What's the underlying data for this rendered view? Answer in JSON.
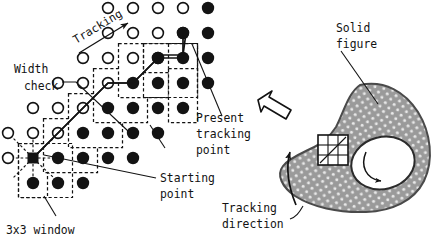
{
  "figure": {
    "background": "#ffffff",
    "ink": "#131313",
    "fill_gray": "#9a9a9a"
  },
  "labels": {
    "tracking": "Tracking",
    "width_check_line1": "Width",
    "width_check_line2": "check",
    "present_line1": "Present",
    "present_line2": "tracking",
    "present_line3": "point",
    "starting_line1": "Starting",
    "starting_line2": "point",
    "window_label": "3x3 window",
    "solid_line1": "Solid",
    "solid_line2": "figure",
    "direction_line1": "Tracking",
    "direction_line2": "direction"
  },
  "grid": {
    "origin_x": 33,
    "origin_y": 183,
    "step": 25,
    "open_radius": 5.4,
    "filled_radius": 6.2,
    "note": "dot lattice; row 0 is bottom. open = background pixel, filled = figure pixel",
    "open_dots": [
      [
        -1,
        1
      ],
      [
        -1,
        2
      ],
      [
        0,
        2
      ],
      [
        0,
        3
      ],
      [
        1,
        2
      ],
      [
        1,
        3
      ],
      [
        1,
        4
      ],
      [
        2,
        4
      ],
      [
        2,
        3
      ],
      [
        2,
        5
      ],
      [
        3,
        5
      ],
      [
        3,
        4
      ],
      [
        3,
        6
      ],
      [
        4,
        6
      ],
      [
        4,
        5
      ],
      [
        4,
        7
      ],
      [
        5,
        7
      ],
      [
        5,
        6
      ],
      [
        5,
        8
      ],
      [
        6,
        8
      ],
      [
        6,
        7
      ],
      [
        6,
        9
      ],
      [
        7,
        9
      ],
      [
        7,
        8
      ],
      [
        8,
        9
      ],
      [
        7,
        10
      ],
      [
        8,
        10
      ]
    ],
    "filled_dots": [
      [
        0,
        0
      ],
      [
        1,
        0
      ],
      [
        2,
        0
      ],
      [
        3,
        0
      ],
      [
        0,
        1
      ],
      [
        1,
        1
      ],
      [
        2,
        1
      ],
      [
        3,
        1
      ],
      [
        4,
        1
      ],
      [
        2,
        2
      ],
      [
        3,
        2
      ],
      [
        4,
        2
      ],
      [
        5,
        2
      ],
      [
        3,
        3
      ],
      [
        4,
        3
      ],
      [
        5,
        3
      ],
      [
        6,
        3
      ],
      [
        4,
        4
      ],
      [
        5,
        4
      ],
      [
        6,
        4
      ],
      [
        7,
        4
      ],
      [
        5,
        5
      ],
      [
        6,
        5
      ],
      [
        7,
        5
      ],
      [
        6,
        6
      ],
      [
        7,
        6
      ],
      [
        8,
        6
      ],
      [
        7,
        7
      ],
      [
        8,
        7
      ],
      [
        8,
        8
      ],
      [
        8,
        9
      ]
    ],
    "starting_point": [
      0,
      1
    ],
    "present_tracking_point": [
      7,
      7
    ]
  },
  "windows": {
    "label": "3x3 sliding windows along the contour",
    "boxes": [
      {
        "cx": 0,
        "cy": 1
      },
      {
        "cx": 1,
        "cy": 2
      },
      {
        "cx": 2,
        "cy": 3
      },
      {
        "cx": 3,
        "cy": 4
      },
      {
        "cx": 4,
        "cy": 5
      },
      {
        "cx": 5,
        "cy": 6
      },
      {
        "cx": 6,
        "cy": 7
      },
      {
        "cx": 7,
        "cy": 8
      }
    ]
  },
  "track_path": {
    "label": "tracking polyline from starting point to present tracking point",
    "points": [
      [
        0,
        1
      ],
      [
        1,
        2
      ],
      [
        2,
        3
      ],
      [
        3,
        4
      ],
      [
        4,
        5
      ],
      [
        5,
        6
      ],
      [
        6,
        7
      ],
      [
        7,
        7
      ]
    ]
  },
  "radial_probe": {
    "label": "8-neighbour dashed probe rays at starting point",
    "directions": 8
  },
  "solid_figure": {
    "label": "speckled closed region with interior hole",
    "hole_label": "interior hole with curved arrow",
    "window_cells": 3
  },
  "arrows": {
    "tracking_arrow": "diagonal up-right arrow",
    "outline_arrow": "hollow arrow pointing up-left",
    "direction_arc": "curved arrow showing tracking direction",
    "hole_arc": "curved arrow inside hole"
  }
}
